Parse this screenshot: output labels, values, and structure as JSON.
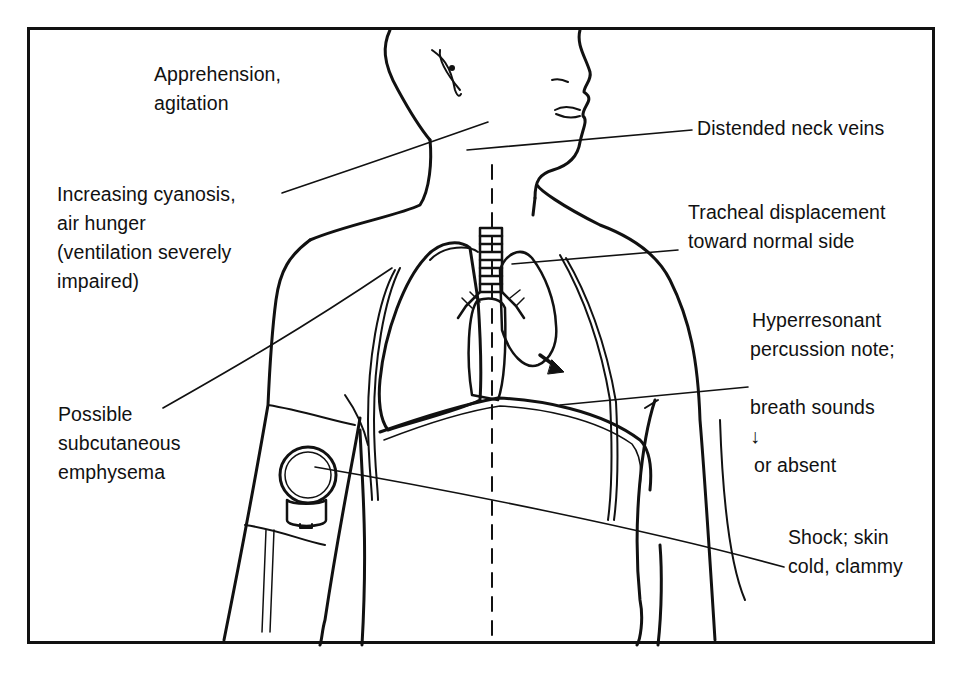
{
  "figure": {
    "type": "medical-illustration",
    "labels": [
      {
        "id": "apprehension",
        "text": "Apprehension,\nagitation"
      },
      {
        "id": "cyanosis",
        "text": "Increasing cyanosis,\nair hunger\n(ventilation severely\nimpaired)"
      },
      {
        "id": "subcutaneous",
        "text": "Possible\nsubcutaneous\nemphysema"
      },
      {
        "id": "neck-veins",
        "text": "Distended neck veins"
      },
      {
        "id": "tracheal",
        "text": "Tracheal displacement\ntoward normal side"
      },
      {
        "id": "hyperresonant_line1",
        "text": "Hyperresonant"
      },
      {
        "id": "hyperresonant_line2",
        "text": "percussion note;"
      },
      {
        "id": "hyperresonant_line3",
        "text": "breath sounds"
      },
      {
        "id": "hyperresonant_arrow",
        "text": "↓"
      },
      {
        "id": "hyperresonant_line4",
        "text": "or absent"
      },
      {
        "id": "shock",
        "text": "Shock; skin\ncold, clammy"
      }
    ],
    "colors": {
      "ink": "#111111",
      "background": "#ffffff"
    }
  }
}
